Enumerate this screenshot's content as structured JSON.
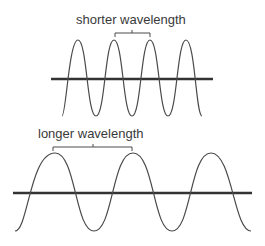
{
  "diagram": {
    "top_wave": {
      "label": "shorter wavelength",
      "peaks": 4,
      "wavelength_px": 36
    },
    "bottom_wave": {
      "label": "longer wavelength",
      "peaks": 3,
      "wavelength_px": 78
    },
    "colors": {
      "wave": "#4a4a4a",
      "axis": "#333333",
      "text": "#3a3a3a"
    }
  }
}
